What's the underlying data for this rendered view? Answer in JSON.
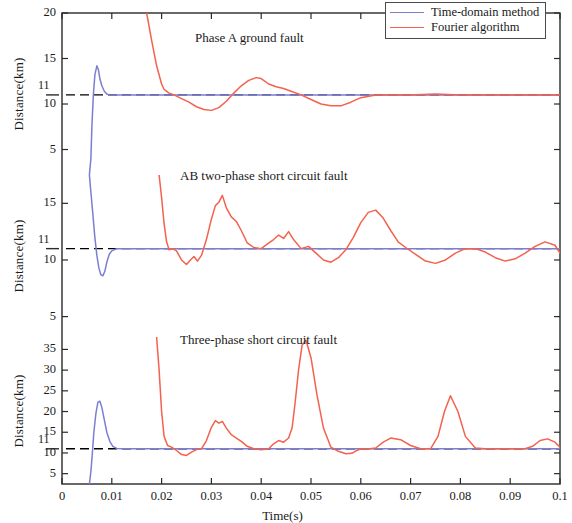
{
  "figure": {
    "xlabel": "Time(s)",
    "ylabel": "Distance(km)",
    "level_label": "11"
  },
  "legend": {
    "position": "top-right",
    "items": [
      {
        "label": "Time-domain method",
        "color": "#7b7fd4"
      },
      {
        "label": "Fourier algorithm",
        "color": "#f4614d"
      }
    ]
  },
  "xticks": [
    "0",
    "0.01",
    "0.02",
    "0.03",
    "0.04",
    "0.05",
    "0.06",
    "0.07",
    "0.08",
    "0.09",
    "0.1"
  ],
  "panels": [
    {
      "title": "Phase A ground fault",
      "yticks": [
        "5",
        "10",
        "15",
        "20"
      ],
      "level_label": "11"
    },
    {
      "title": "AB two-phase short circuit fault",
      "yticks": [
        "5",
        "10",
        "15"
      ],
      "level_label": "11"
    },
    {
      "title": "Three-phase short circuit fault",
      "yticks": [
        "5",
        "10",
        "15",
        "20",
        "25",
        "30",
        "35"
      ],
      "level_label": "11"
    }
  ],
  "chart_data": {
    "type": "line",
    "title": "",
    "xlabel": "Time(s)",
    "ylabel": "Distance(km)",
    "xlim": [
      0,
      0.1
    ],
    "grid": false,
    "legend_position": "top-right",
    "reference_line": {
      "value": 11,
      "style": "dashed",
      "color": "#000000",
      "label": "11"
    },
    "subplots": [
      {
        "name": "Phase A ground fault",
        "ylim": [
          2.2,
          20
        ],
        "yticks": [
          5,
          10,
          15,
          20
        ],
        "series": [
          {
            "name": "Time-domain method",
            "color": "#7b7fd4",
            "x": [
              0.0055,
              0.0058,
              0.006,
              0.0063,
              0.0066,
              0.007,
              0.0073,
              0.0076,
              0.008,
              0.0085,
              0.009,
              0.0095,
              0.01,
              0.011,
              0.012,
              0.014,
              0.017,
              0.02,
              0.03,
              0.05,
              0.07,
              0.1
            ],
            "y": [
              2.2,
              4.0,
              7.5,
              11.0,
              13.2,
              14.2,
              13.8,
              12.8,
              12.0,
              11.4,
              11.1,
              11.0,
              11.0,
              11.0,
              11.0,
              11.0,
              11.0,
              11.0,
              11.0,
              11.0,
              11.0,
              11.0
            ]
          },
          {
            "name": "Fourier algorithm",
            "color": "#f4614d",
            "x": [
              0.017,
              0.018,
              0.019,
              0.02,
              0.0205,
              0.0215,
              0.0225,
              0.024,
              0.0255,
              0.027,
              0.0285,
              0.03,
              0.0315,
              0.033,
              0.0345,
              0.036,
              0.0375,
              0.039,
              0.04,
              0.0415,
              0.043,
              0.0445,
              0.046,
              0.048,
              0.05,
              0.052,
              0.054,
              0.056,
              0.058,
              0.06,
              0.063,
              0.066,
              0.07,
              0.075,
              0.08,
              0.085,
              0.09,
              0.095,
              0.1
            ],
            "y": [
              20.0,
              17.0,
              14.2,
              12.2,
              11.6,
              11.2,
              11.0,
              10.6,
              10.2,
              9.7,
              9.4,
              9.3,
              9.6,
              10.3,
              11.2,
              12.0,
              12.6,
              12.9,
              12.8,
              12.2,
              11.9,
              11.7,
              11.4,
              11.0,
              10.5,
              10.0,
              9.8,
              9.8,
              10.2,
              10.7,
              11.0,
              11.0,
              11.0,
              11.1,
              11.0,
              11.0,
              11.0,
              11.0,
              11.0
            ]
          }
        ]
      },
      {
        "name": "AB two-phase short circuit fault",
        "ylim": [
          3.2,
          17.5
        ],
        "yticks": [
          5,
          10,
          15
        ],
        "series": [
          {
            "name": "Time-domain method",
            "color": "#7b7fd4",
            "x": [
              0.0055,
              0.0058,
              0.0062,
              0.0066,
              0.007,
              0.0074,
              0.0078,
              0.0082,
              0.0086,
              0.009,
              0.0095,
              0.01,
              0.011,
              0.013,
              0.016,
              0.02,
              0.04,
              0.07,
              0.1
            ],
            "y": [
              17.5,
              16.0,
              14.0,
              12.0,
              10.4,
              9.3,
              8.7,
              8.6,
              9.0,
              9.8,
              10.5,
              10.8,
              11.0,
              11.0,
              11.0,
              11.0,
              11.0,
              11.0,
              11.0
            ]
          },
          {
            "name": "Fourier algorithm",
            "color": "#f4614d",
            "x": [
              0.0195,
              0.02,
              0.0205,
              0.021,
              0.0215,
              0.0222,
              0.023,
              0.024,
              0.025,
              0.0258,
              0.0265,
              0.0272,
              0.028,
              0.029,
              0.03,
              0.0308,
              0.0315,
              0.0322,
              0.033,
              0.034,
              0.035,
              0.036,
              0.0372,
              0.0385,
              0.04,
              0.0412,
              0.0425,
              0.0435,
              0.0445,
              0.0455,
              0.0465,
              0.048,
              0.0495,
              0.051,
              0.0525,
              0.054,
              0.0555,
              0.057,
              0.0585,
              0.06,
              0.0615,
              0.063,
              0.0645,
              0.066,
              0.0675,
              0.069,
              0.071,
              0.073,
              0.075,
              0.077,
              0.079,
              0.081,
              0.083,
              0.085,
              0.087,
              0.089,
              0.091,
              0.093,
              0.095,
              0.097,
              0.099,
              0.1
            ],
            "y": [
              17.5,
              15.5,
              13.2,
              11.6,
              10.9,
              11.0,
              10.8,
              10.0,
              9.6,
              10.0,
              10.3,
              9.9,
              10.4,
              11.8,
              13.6,
              14.8,
              15.1,
              15.7,
              14.6,
              13.8,
              13.4,
              12.6,
              11.5,
              11.1,
              11.0,
              11.4,
              11.8,
              12.2,
              11.9,
              12.5,
              11.8,
              11.0,
              11.2,
              10.6,
              10.0,
              9.8,
              10.2,
              10.9,
              12.0,
              13.3,
              14.2,
              14.4,
              13.7,
              12.6,
              11.6,
              11.1,
              10.5,
              9.9,
              9.7,
              10.0,
              10.6,
              11.0,
              11.0,
              10.7,
              10.2,
              9.9,
              10.1,
              10.6,
              11.2,
              11.6,
              11.3,
              10.6
            ]
          }
        ]
      },
      {
        "name": "Three-phase short circuit fault",
        "ylim": [
          2.5,
          38
        ],
        "yticks": [
          5,
          10,
          15,
          20,
          25,
          30,
          35
        ],
        "series": [
          {
            "name": "Time-domain method",
            "color": "#7b7fd4",
            "x": [
              0.0055,
              0.0058,
              0.0061,
              0.0064,
              0.0068,
              0.0072,
              0.0076,
              0.008,
              0.0085,
              0.009,
              0.0096,
              0.0102,
              0.011,
              0.0125,
              0.015,
              0.02,
              0.04,
              0.07,
              0.1
            ],
            "y": [
              2.5,
              5.5,
              10.0,
              15.0,
              19.5,
              22.2,
              22.5,
              21.0,
              18.0,
              15.0,
              12.8,
              11.6,
              11.1,
              11.0,
              11.0,
              11.0,
              11.0,
              11.0,
              11.0
            ]
          },
          {
            "name": "Fourier algorithm",
            "color": "#f4614d",
            "x": [
              0.019,
              0.0195,
              0.02,
              0.0205,
              0.0212,
              0.022,
              0.023,
              0.024,
              0.025,
              0.026,
              0.027,
              0.028,
              0.029,
              0.03,
              0.0308,
              0.0315,
              0.0322,
              0.033,
              0.034,
              0.035,
              0.036,
              0.0372,
              0.0385,
              0.04,
              0.0415,
              0.0425,
              0.0435,
              0.0445,
              0.0455,
              0.0462,
              0.0468,
              0.0475,
              0.0482,
              0.049,
              0.05,
              0.0512,
              0.0525,
              0.054,
              0.0555,
              0.057,
              0.0582,
              0.0592,
              0.06,
              0.0608,
              0.0618,
              0.063,
              0.0645,
              0.066,
              0.068,
              0.07,
              0.072,
              0.074,
              0.0755,
              0.0768,
              0.078,
              0.0795,
              0.081,
              0.083,
              0.085,
              0.087,
              0.089,
              0.091,
              0.093,
              0.0945,
              0.096,
              0.0975,
              0.099,
              0.1
            ],
            "y": [
              38.0,
              30.0,
              20.0,
              14.0,
              11.8,
              11.4,
              10.6,
              9.6,
              9.4,
              10.2,
              10.8,
              11.0,
              13.0,
              16.2,
              17.8,
              17.2,
              17.6,
              16.0,
              14.4,
              13.6,
              12.8,
              11.6,
              11.0,
              10.8,
              11.0,
              12.2,
              13.0,
              12.6,
              13.6,
              16.0,
              22.0,
              30.0,
              36.0,
              37.2,
              33.0,
              24.0,
              16.0,
              11.4,
              10.4,
              9.8,
              9.9,
              10.6,
              11.0,
              11.0,
              11.0,
              11.2,
              12.6,
              13.6,
              13.2,
              11.8,
              11.0,
              11.0,
              14.0,
              20.0,
              23.8,
              20.0,
              14.0,
              11.2,
              11.0,
              11.0,
              11.0,
              11.0,
              11.0,
              11.6,
              13.0,
              13.4,
              12.6,
              11.4
            ]
          }
        ]
      }
    ]
  }
}
